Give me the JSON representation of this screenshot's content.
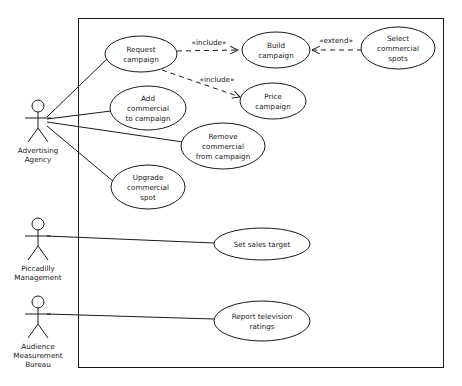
{
  "diagram": {
    "type": "uml-use-case-diagram",
    "stroke_color": "#1a1a1a",
    "fill_color": "#ffffff",
    "system_boundary": {
      "x": 78,
      "y": 18,
      "width": 366,
      "height": 350
    },
    "actors": [
      {
        "id": "advertising-agency",
        "label_lines": [
          "Advertising",
          "Agency"
        ],
        "x": 38,
        "y": 110
      },
      {
        "id": "piccadilly-management",
        "label_lines": [
          "Piccadilly",
          "Management"
        ],
        "x": 38,
        "y": 227
      },
      {
        "id": "audience-measurement-bureau",
        "label_lines": [
          "Audience",
          "Measurement",
          "Bureau"
        ],
        "x": 38,
        "y": 305
      }
    ],
    "use_cases": [
      {
        "id": "request-campaign",
        "label_lines": [
          "Request",
          "campaign"
        ],
        "cx": 141,
        "cy": 54,
        "rx": 36,
        "ry": 18
      },
      {
        "id": "build-campaign",
        "label_lines": [
          "Build",
          "campaign"
        ],
        "cx": 276,
        "cy": 50,
        "rx": 33,
        "ry": 18
      },
      {
        "id": "select-commercial-spots",
        "label_lines": [
          "Select",
          "commercial",
          "spots"
        ],
        "cx": 398,
        "cy": 48,
        "rx": 36,
        "ry": 21
      },
      {
        "id": "price-campaign",
        "label_lines": [
          "Price",
          "campaign"
        ],
        "cx": 273,
        "cy": 101,
        "rx": 33,
        "ry": 18
      },
      {
        "id": "add-commercial-to-campaign",
        "label_lines": [
          "Add",
          "commercial",
          "to campaign"
        ],
        "cx": 148,
        "cy": 108,
        "rx": 38,
        "ry": 22
      },
      {
        "id": "remove-commercial-from-campaign",
        "label_lines": [
          "Remove",
          "commercial",
          "from campaign"
        ],
        "cx": 223,
        "cy": 146,
        "rx": 42,
        "ry": 23
      },
      {
        "id": "upgrade-commercial-spot",
        "label_lines": [
          "Upgrade",
          "commercial",
          "spot"
        ],
        "cx": 148,
        "cy": 187,
        "rx": 36,
        "ry": 22
      },
      {
        "id": "set-sales-target",
        "label_lines": [
          "Set sales target"
        ],
        "cx": 262,
        "cy": 244,
        "rx": 48,
        "ry": 16
      },
      {
        "id": "report-television-ratings",
        "label_lines": [
          "Report television",
          "ratings"
        ],
        "cx": 262,
        "cy": 321,
        "rx": 48,
        "ry": 20
      }
    ],
    "relationships": [
      {
        "id": "include-request-build",
        "label": "«include»",
        "label_x": 209,
        "label_y": 45,
        "style": "dashed"
      },
      {
        "id": "include-request-price",
        "label": "«include»",
        "label_x": 215,
        "label_y": 82,
        "style": "dashed"
      },
      {
        "id": "extend-select-build",
        "label": "«extend»",
        "label_x": 335,
        "label_y": 43,
        "style": "dashed"
      }
    ]
  }
}
